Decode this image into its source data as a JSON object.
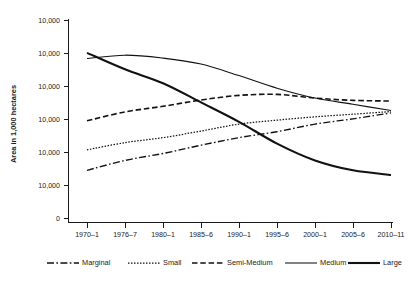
{
  "chart_data": {
    "type": "line",
    "title": "",
    "subtitle": "",
    "xlabel": "",
    "ylabel": "Area in 1,000 hectares",
    "categories": [
      "1970–1",
      "1976–7",
      "1980–1",
      "1985–6",
      "1990–1",
      "1995–6",
      "2000–1",
      "2005–6",
      "2010–11"
    ],
    "ytick_labels": [
      "10,000",
      "10,000",
      "10,000",
      "10,000",
      "10,000",
      "10,000",
      "0"
    ],
    "ytick_values": [
      60000,
      50000,
      40000,
      30000,
      20000,
      10000,
      0
    ],
    "ylim": [
      0,
      60000
    ],
    "grid": false,
    "legend_position": "bottom",
    "series": [
      {
        "name": "Marginal",
        "line_style": "dash-dot",
        "color": "#111111",
        "values": [
          14600,
          17600,
          19700,
          22200,
          24500,
          26300,
          28600,
          30200,
          32000
        ]
      },
      {
        "name": "Small",
        "line_style": "dotted",
        "color": "#111111",
        "values": [
          20800,
          23000,
          24500,
          26500,
          28600,
          29800,
          30800,
          31600,
          32400
        ]
      },
      {
        "name": "Semi-Medium",
        "line_style": "dashed",
        "color": "#111111",
        "values": [
          29600,
          32300,
          34000,
          35900,
          37300,
          37600,
          36500,
          35800,
          35600
        ]
      },
      {
        "name": "Medium",
        "line_style": "solid-thin",
        "color": "#111111",
        "values": [
          48500,
          49500,
          48600,
          46800,
          43300,
          39500,
          36500,
          34600,
          32700
        ]
      },
      {
        "name": "Large",
        "line_style": "solid-thick",
        "color": "#111111",
        "values": [
          50200,
          45200,
          41000,
          35200,
          29300,
          22700,
          17600,
          14600,
          13200
        ]
      }
    ]
  },
  "legend": {
    "items": [
      {
        "label": "Marginal",
        "style": "dash-dot"
      },
      {
        "label": "Small",
        "style": "dotted"
      },
      {
        "label": "Semi-Medium",
        "style": "dashed"
      },
      {
        "label": "Medium",
        "style": "solid-thin"
      },
      {
        "label": "Large",
        "style": "solid-thick"
      }
    ]
  },
  "axes": {
    "y_title": "Area in 1,000 hectares",
    "y_ticks": [
      "10,000",
      "10,000",
      "10,000",
      "10,000",
      "10,000",
      "10,000",
      "0"
    ],
    "x_ticks": [
      "1970–1",
      "1976–7",
      "1980–1",
      "1985–6",
      "1990–1",
      "1995–6",
      "2000–1",
      "2005–6",
      "2010–11"
    ]
  }
}
